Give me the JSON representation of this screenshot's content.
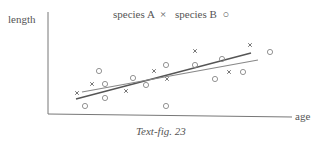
{
  "chart_data": {
    "type": "scatter",
    "title": "",
    "xlabel": "age",
    "ylabel": "length",
    "caption": "Text-fig. 23",
    "legend": [
      {
        "name": "species A",
        "marker": "×"
      },
      {
        "name": "species B",
        "marker": "○"
      }
    ],
    "axes_origin_px": [
      48,
      114
    ],
    "series": [
      {
        "name": "species A",
        "marker": "cross",
        "points_px": [
          [
            77,
            93
          ],
          [
            92,
            84
          ],
          [
            126,
            91
          ],
          [
            154,
            71
          ],
          [
            167,
            79
          ],
          [
            195,
            51
          ],
          [
            229,
            72
          ],
          [
            250,
            45
          ]
        ]
      },
      {
        "name": "species B",
        "marker": "circle",
        "points_px": [
          [
            85,
            106
          ],
          [
            99,
            71
          ],
          [
            105,
            84
          ],
          [
            105,
            98
          ],
          [
            133,
            78
          ],
          [
            146,
            85
          ],
          [
            166,
            65
          ],
          [
            166,
            106
          ],
          [
            195,
            65
          ],
          [
            215,
            79
          ],
          [
            222,
            59
          ],
          [
            243,
            72
          ],
          [
            270,
            52
          ]
        ]
      }
    ],
    "regression_lines_px": [
      {
        "name": "line 1 (darker)",
        "from": [
          76,
          99
        ],
        "to": [
          251,
          53
        ]
      },
      {
        "name": "line 2 (lighter)",
        "from": [
          82,
          92
        ],
        "to": [
          258,
          60
        ]
      }
    ],
    "grid": false
  },
  "labels": {
    "ylabel": "length",
    "xlabel": "age",
    "legend_a": "species A",
    "legend_a_marker": "×",
    "legend_b": "species B",
    "legend_b_marker": "○",
    "caption": "Text-fig. 23"
  }
}
